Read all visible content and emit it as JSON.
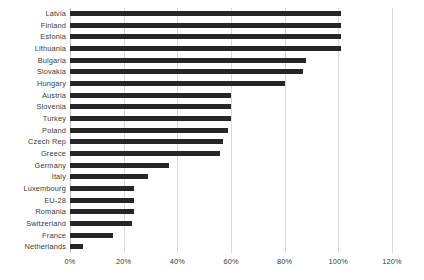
{
  "chart_data": {
    "type": "bar",
    "orientation": "horizontal",
    "title": "",
    "subtitle": "",
    "xlabel": "",
    "ylabel": "",
    "xlim": [
      0,
      120
    ],
    "grid": true,
    "legend": false,
    "legend_position": "none",
    "bar_color": "#262626",
    "gridline_color": "#d9d9d9",
    "axis_color": "#bfbfbf",
    "x_ticks": [
      0,
      20,
      40,
      60,
      80,
      100,
      120
    ],
    "x_tick_labels": [
      "0%",
      "20%",
      "40%",
      "60%",
      "80%",
      "100%",
      "120%"
    ],
    "categories": [
      "Latvia",
      "Finland",
      "Estonia",
      "Lithuania",
      "Bulgaria",
      "Slovakia",
      "Hungary",
      "Austria",
      "Slovenia",
      "Turkey",
      "Poland",
      "Czech Rep",
      "Greece",
      "Germany",
      "Italy",
      "Luxembourg",
      "EU-28",
      "Romania",
      "Switzerland",
      "France",
      "Netherlands"
    ],
    "values": [
      101,
      101,
      101,
      101,
      88,
      87,
      80,
      60,
      60,
      60,
      59,
      57,
      56,
      37,
      29,
      24,
      24,
      24,
      23,
      16,
      5
    ]
  }
}
